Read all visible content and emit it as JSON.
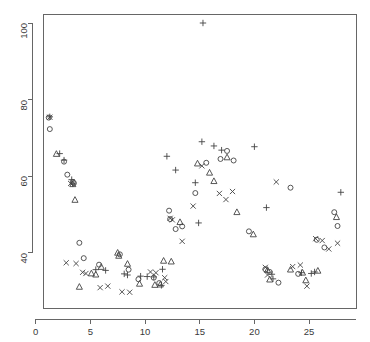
{
  "chart_data": {
    "type": "scatter",
    "title": "",
    "xlabel": "",
    "ylabel": "",
    "xlim": [
      0,
      28.8
    ],
    "ylim": [
      28,
      103
    ],
    "grid": false,
    "legend_position": "none",
    "xticks": [
      0,
      5,
      10,
      15,
      20,
      25
    ],
    "yticks": [
      40,
      60,
      80,
      100
    ],
    "xtick_labels": [
      "0",
      "5",
      "10",
      "15",
      "20",
      "25"
    ],
    "ytick_labels": [
      "40",
      "60",
      "80",
      "100"
    ],
    "marker_colors": {
      "all": "#444444"
    },
    "axis_color": "#666666",
    "background": "#ffffff",
    "series": [
      {
        "name": "circle",
        "marker": "o",
        "points": [
          [
            1.2,
            75.3
          ],
          [
            1.3,
            72.3
          ],
          [
            2.6,
            63.8
          ],
          [
            2.9,
            60.4
          ],
          [
            3.4,
            58.5
          ],
          [
            3.5,
            58.2
          ],
          [
            4.0,
            42.6
          ],
          [
            4.4,
            38.6
          ],
          [
            5.8,
            36.9
          ],
          [
            7.7,
            39.6
          ],
          [
            8.5,
            35.6
          ],
          [
            9.4,
            33.1
          ],
          [
            10.8,
            33.5
          ],
          [
            11.3,
            32.1
          ],
          [
            12.2,
            51.0
          ],
          [
            12.3,
            48.8
          ],
          [
            12.8,
            46.2
          ],
          [
            13.4,
            46.9
          ],
          [
            14.6,
            55.6
          ],
          [
            15.6,
            63.5
          ],
          [
            16.9,
            64.5
          ],
          [
            17.5,
            66.6
          ],
          [
            18.1,
            64.1
          ],
          [
            19.5,
            45.6
          ],
          [
            21.0,
            35.7
          ],
          [
            21.4,
            35.0
          ],
          [
            22.2,
            32.2
          ],
          [
            23.3,
            57.0
          ],
          [
            24.0,
            34.5
          ],
          [
            25.7,
            43.4
          ],
          [
            26.4,
            41.4
          ],
          [
            27.3,
            50.6
          ],
          [
            27.6,
            47.0
          ]
        ]
      },
      {
        "name": "plus",
        "marker": "+",
        "points": [
          [
            1.3,
            75.5
          ],
          [
            2.2,
            65.9
          ],
          [
            2.6,
            64.2
          ],
          [
            3.3,
            59.1
          ],
          [
            3.4,
            58.0
          ],
          [
            5.5,
            35.6
          ],
          [
            6.4,
            35.4
          ],
          [
            8.1,
            34.5
          ],
          [
            8.4,
            34.2
          ],
          [
            9.6,
            33.9
          ],
          [
            10.2,
            33.8
          ],
          [
            10.8,
            33.7
          ],
          [
            11.6,
            35.7
          ],
          [
            11.5,
            31.5
          ],
          [
            12.0,
            65.2
          ],
          [
            12.8,
            61.6
          ],
          [
            14.6,
            58.3
          ],
          [
            15.2,
            69.0
          ],
          [
            15.3,
            100.0
          ],
          [
            16.3,
            67.9
          ],
          [
            17.0,
            66.8
          ],
          [
            14.9,
            47.8
          ],
          [
            20.0,
            67.7
          ],
          [
            21.1,
            51.8
          ],
          [
            21.6,
            34.4
          ],
          [
            21.7,
            33.2
          ],
          [
            24.3,
            34.8
          ],
          [
            25.2,
            34.6
          ],
          [
            25.5,
            35.0
          ],
          [
            27.9,
            55.8
          ]
        ]
      },
      {
        "name": "cross",
        "marker": "x",
        "points": [
          [
            1.3,
            75.4
          ],
          [
            3.2,
            58.1
          ],
          [
            2.8,
            37.4
          ],
          [
            3.7,
            37.2
          ],
          [
            4.3,
            34.9
          ],
          [
            4.6,
            34.6
          ],
          [
            5.9,
            30.9
          ],
          [
            6.6,
            31.3
          ],
          [
            7.9,
            29.8
          ],
          [
            8.6,
            29.7
          ],
          [
            10.5,
            35.0
          ],
          [
            11.0,
            34.8
          ],
          [
            11.8,
            33.5
          ],
          [
            11.9,
            32.5
          ],
          [
            12.3,
            49.0
          ],
          [
            12.5,
            48.6
          ],
          [
            13.4,
            43.0
          ],
          [
            14.4,
            52.2
          ],
          [
            15.2,
            62.7
          ],
          [
            16.8,
            55.5
          ],
          [
            17.4,
            53.9
          ],
          [
            18.0,
            56.0
          ],
          [
            21.0,
            36.2
          ],
          [
            21.2,
            34.2
          ],
          [
            22.0,
            58.5
          ],
          [
            23.5,
            36.4
          ],
          [
            24.2,
            36.8
          ],
          [
            24.8,
            31.3
          ],
          [
            25.6,
            43.7
          ],
          [
            26.2,
            43.2
          ],
          [
            26.8,
            41.0
          ],
          [
            27.6,
            42.5
          ]
        ]
      },
      {
        "name": "triangle",
        "marker": "t",
        "points": [
          [
            1.9,
            65.8
          ],
          [
            3.4,
            57.9
          ],
          [
            3.6,
            53.8
          ],
          [
            4.0,
            31.1
          ],
          [
            5.1,
            34.6
          ],
          [
            5.5,
            34.3
          ],
          [
            6.0,
            36.3
          ],
          [
            7.5,
            40.0
          ],
          [
            7.6,
            39.2
          ],
          [
            8.4,
            37.1
          ],
          [
            9.5,
            31.9
          ],
          [
            10.9,
            31.6
          ],
          [
            11.4,
            31.7
          ],
          [
            11.7,
            37.9
          ],
          [
            12.4,
            37.7
          ],
          [
            13.2,
            48.0
          ],
          [
            14.8,
            63.3
          ],
          [
            15.9,
            60.9
          ],
          [
            16.3,
            58.7
          ],
          [
            17.5,
            64.9
          ],
          [
            18.4,
            50.6
          ],
          [
            19.9,
            44.8
          ],
          [
            21.2,
            35.5
          ],
          [
            21.4,
            33.0
          ],
          [
            23.3,
            35.6
          ],
          [
            24.4,
            34.8
          ],
          [
            24.7,
            32.8
          ],
          [
            25.8,
            35.3
          ],
          [
            27.5,
            49.3
          ]
        ]
      }
    ]
  }
}
